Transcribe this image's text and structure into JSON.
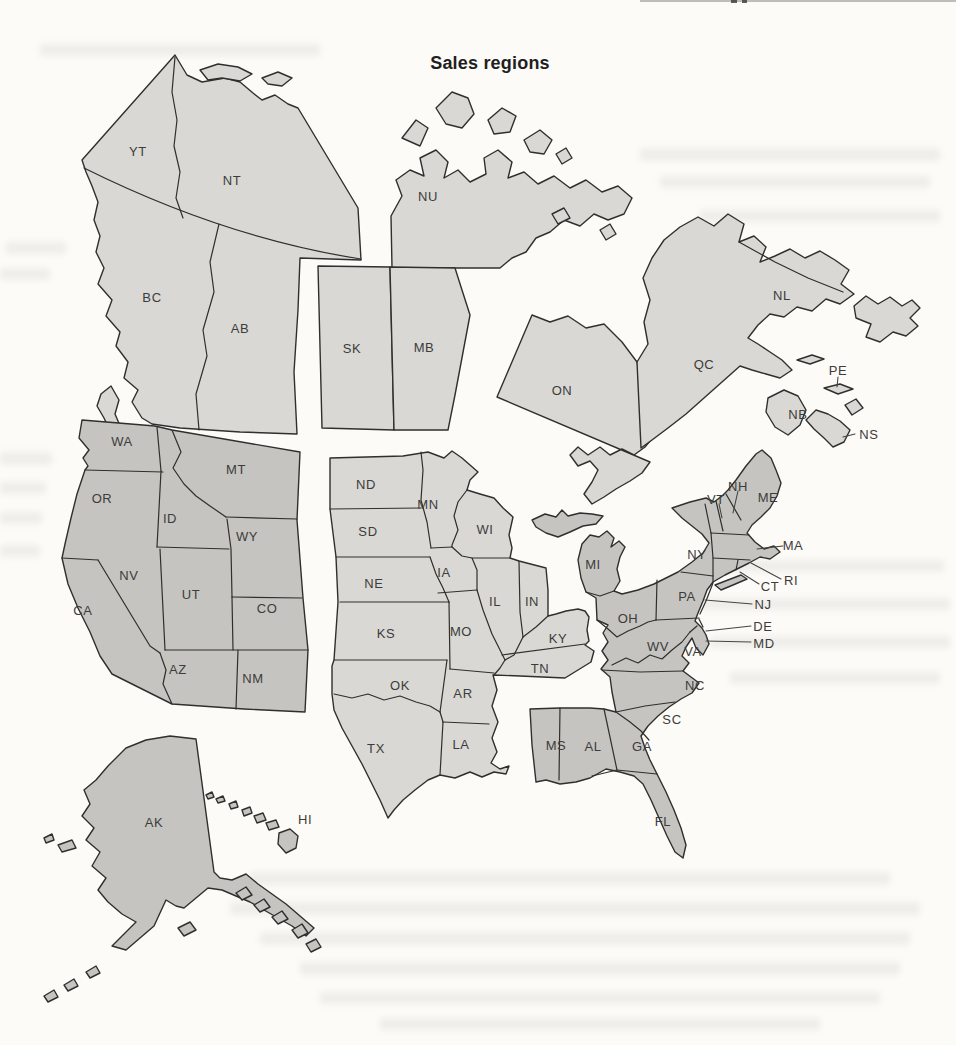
{
  "page": {
    "title": "Sales regions"
  },
  "fills": {
    "canada": "#d9d8d4",
    "us_west": "#c5c4c0",
    "us_central": "#d9d8d4",
    "us_east": "#c5c4c0",
    "outline": "#2f2f2d",
    "label_color": "#3c3c3b"
  },
  "regions": [
    {
      "name": "Canada",
      "shade": "light",
      "fill": "#d9d8d4",
      "members": [
        "YT",
        "NT",
        "NU",
        "BC",
        "AB",
        "SK",
        "MB",
        "ON",
        "QC",
        "NL",
        "PE",
        "NB",
        "NS"
      ]
    },
    {
      "name": "US West",
      "shade": "dark",
      "fill": "#c5c4c0",
      "members": [
        "WA",
        "OR",
        "CA",
        "NV",
        "ID",
        "MT",
        "WY",
        "UT",
        "CO",
        "AZ",
        "NM",
        "AK",
        "HI"
      ]
    },
    {
      "name": "US Central",
      "shade": "light",
      "fill": "#d9d8d4",
      "members": [
        "ND",
        "SD",
        "NE",
        "KS",
        "OK",
        "TX",
        "MN",
        "IA",
        "MO",
        "AR",
        "LA",
        "WI",
        "IL",
        "IN",
        "KY",
        "TN"
      ]
    },
    {
      "name": "US East",
      "shade": "dark",
      "fill": "#c5c4c0",
      "members": [
        "MI",
        "OH",
        "NY",
        "PA",
        "WV",
        "VA",
        "NC",
        "SC",
        "GA",
        "FL",
        "MS",
        "AL",
        "ME",
        "NH",
        "VT",
        "MA",
        "RI",
        "CT",
        "NJ",
        "DE",
        "MD"
      ]
    }
  ],
  "labels": {
    "YT": "YT",
    "NT": "NT",
    "NU": "NU",
    "BC": "BC",
    "AB": "AB",
    "SK": "SK",
    "MB": "MB",
    "ON": "ON",
    "QC": "QC",
    "NL": "NL",
    "PE": "PE",
    "NB": "NB",
    "NS": "NS",
    "WA": "WA",
    "OR": "OR",
    "CA": "CA",
    "NV": "NV",
    "ID": "ID",
    "MT": "MT",
    "WY": "WY",
    "UT": "UT",
    "CO": "CO",
    "AZ": "AZ",
    "NM": "NM",
    "AK": "AK",
    "HI": "HI",
    "ND": "ND",
    "SD": "SD",
    "NE": "NE",
    "KS": "KS",
    "OK": "OK",
    "TX": "TX",
    "MN": "MN",
    "IA": "IA",
    "MO": "MO",
    "AR": "AR",
    "LA": "LA",
    "WI": "WI",
    "IL": "IL",
    "IN": "IN",
    "KY": "KY",
    "TN": "TN",
    "MI": "MI",
    "OH": "OH",
    "NY": "NY",
    "PA": "PA",
    "WV": "WV",
    "VA": "VA",
    "NC": "NC",
    "SC": "SC",
    "GA": "GA",
    "FL": "FL",
    "MS": "MS",
    "AL": "AL",
    "ME": "ME",
    "NH": "NH",
    "VT": "VT",
    "MA": "MA",
    "RI": "RI",
    "CT": "CT",
    "NJ": "NJ",
    "DE": "DE",
    "MD": "MD"
  }
}
